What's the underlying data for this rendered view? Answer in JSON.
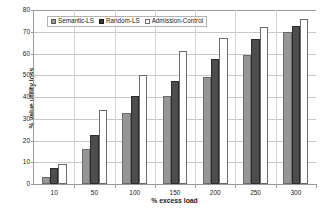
{
  "chart_data": {
    "type": "bar",
    "title": "",
    "xlabel": "% excess load",
    "ylabel": "% value utility loss",
    "categories": [
      "10",
      "50",
      "100",
      "150",
      "200",
      "250",
      "300"
    ],
    "series": [
      {
        "name": "Semantic-LS",
        "color": "#969696",
        "values": [
          3,
          16,
          32.5,
          40.5,
          49,
          59.5,
          70
        ]
      },
      {
        "name": "Random-LS",
        "color": "#4d4d4d",
        "values": [
          7.5,
          22.5,
          40.5,
          47.5,
          57.5,
          66.5,
          72.5
        ]
      },
      {
        "name": "Admission-Control",
        "color": "#ffffff",
        "values": [
          9,
          34,
          50,
          61,
          67,
          72,
          76
        ]
      }
    ],
    "ylim": [
      0,
      80
    ],
    "yticks": [
      0,
      10,
      20,
      30,
      40,
      50,
      60,
      70,
      80
    ],
    "ytick_labels": [
      "0",
      "10",
      "20",
      "30",
      "40",
      "50",
      "60",
      "70",
      "80"
    ],
    "grid": true,
    "legend_position": "top-left-inside"
  },
  "legend": {
    "entries": [
      {
        "label": "Semantic-LS"
      },
      {
        "label": "Random-LS"
      },
      {
        "label": "Admission-Control"
      }
    ]
  },
  "caption": {
    "sliver_text": ""
  }
}
